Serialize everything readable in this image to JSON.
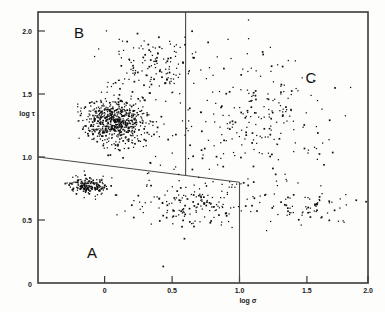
{
  "chart_data": {
    "type": "scatter",
    "title": "",
    "xlabel": "log σ",
    "ylabel": "log τ",
    "xlim": [
      -0.45,
      2.0
    ],
    "ylim": [
      0.0,
      2.15
    ],
    "grid": false,
    "legend_position": "none",
    "xticks": [
      0,
      0.5,
      1.0,
      1.5,
      2.0
    ],
    "xtick_labels": [
      "0",
      "0.5",
      "1.0",
      "1.5",
      "2.0"
    ],
    "yticks": [
      0.5,
      1.0,
      1.5,
      2.0
    ],
    "ytick_labels": [
      "0.5",
      "1.0",
      "1.5",
      "2.0"
    ],
    "origin_label": "0",
    "region_labels": [
      {
        "name": "A",
        "x": 0.02,
        "y": 0.33
      },
      {
        "name": "B",
        "x": 0.02,
        "y": 2.0
      },
      {
        "name": "C",
        "x": 1.47,
        "y": 1.75
      }
    ],
    "dividers": [
      {
        "name": "vertical-upper",
        "x1": 0.6,
        "y1": 2.15,
        "x2": 0.6,
        "y2": 0.855
      },
      {
        "name": "slanted",
        "x1": -0.45,
        "y1": 1.0,
        "x2": 1.0,
        "y2": 0.8
      },
      {
        "name": "vertical-lower",
        "x1": 1.0,
        "y1": 0.8,
        "x2": 1.0,
        "y2": 0.0
      }
    ],
    "clusters": [
      {
        "name": "main-dense-cluster",
        "cx": 0.13,
        "cy": 1.28,
        "n": 620,
        "spread_x": 0.2,
        "spread_y": 0.16
      },
      {
        "name": "lower-left-cluster",
        "cx": -0.07,
        "cy": 0.77,
        "n": 180,
        "spread_x": 0.12,
        "spread_y": 0.055
      },
      {
        "name": "upper-scatter",
        "cx": 0.4,
        "cy": 1.72,
        "n": 150,
        "spread_x": 0.28,
        "spread_y": 0.22
      },
      {
        "name": "right-sparse-field",
        "cx": 1.25,
        "cy": 1.35,
        "n": 170,
        "spread_x": 0.42,
        "spread_y": 0.42
      },
      {
        "name": "lower-band",
        "cx": 0.75,
        "cy": 0.62,
        "n": 160,
        "spread_x": 0.4,
        "spread_y": 0.16
      },
      {
        "name": "far-right-low",
        "cx": 1.6,
        "cy": 0.6,
        "n": 70,
        "spread_x": 0.3,
        "spread_y": 0.12
      },
      {
        "name": "background-sparse",
        "cx": 0.7,
        "cy": 1.05,
        "n": 120,
        "spread_x": 0.6,
        "spread_y": 0.55
      }
    ],
    "point_count_estimate": 1470,
    "point_color": "#0d0d0d",
    "axis_color": "#3b3b3b"
  },
  "figure": {
    "background": "#fdfdfc",
    "frame": {
      "left_px": 38,
      "right_px": 368,
      "top_px": 12,
      "bottom_px": 283
    }
  }
}
